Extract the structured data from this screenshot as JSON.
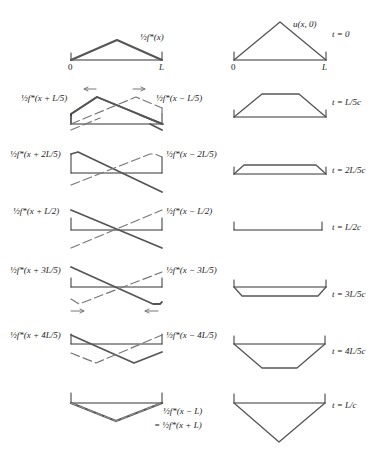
{
  "colors": {
    "solid": "#555555",
    "dashed": "#777777",
    "axis": "#333333",
    "text": "#222222"
  },
  "axis_labels": {
    "zero": "0",
    "L": "L"
  },
  "left_column": {
    "panels": [
      {
        "label_left": "",
        "label_right": "½f*(x)"
      },
      {
        "label_left": "½f*(x + L/5)",
        "label_right": "½f*(x − L/5)",
        "arrows": "outward"
      },
      {
        "label_left": "½f*(x + 2L/5)",
        "label_right": "½f*(x − 2L/5)"
      },
      {
        "label_left": "½f*(x + L/2)",
        "label_right": "½f*(x − L/2)"
      },
      {
        "label_left": "½f*(x + 3L/5)",
        "label_right": "½f*(x − 3L/5)",
        "arrows": "inward"
      },
      {
        "label_left": "½f*(x + 4L/5)",
        "label_right": "½f*(x − 4L/5)"
      },
      {
        "label_left": "",
        "label_right": "½f*(x − L)",
        "label_right2": "= ½f*(x + L)"
      }
    ]
  },
  "right_column": {
    "curve_label": "u(x, 0)",
    "times": [
      "t = 0",
      "t = L/5c",
      "t = 2L/5c",
      "t = L/2c",
      "t = 3L/5c",
      "t = 4L/5c",
      "t = L/c"
    ]
  }
}
